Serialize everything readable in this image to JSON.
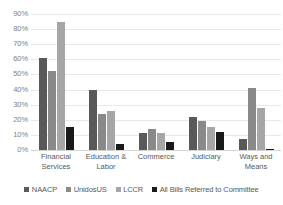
{
  "chart_data": {
    "type": "bar",
    "title": "",
    "subtitle": "",
    "xlabel": "",
    "ylabel": "",
    "ylim": [
      0,
      90
    ],
    "ytick_step": 10,
    "ytick_labels": [
      "90%",
      "80%",
      "70%",
      "60%",
      "50%",
      "40%",
      "30%",
      "20%",
      "10%",
      "0%"
    ],
    "grid": true,
    "grid_orientation": "horizontal",
    "legend_position": "bottom",
    "value_unit": "%",
    "categories": [
      "Financial Services",
      "Education & Labor",
      "Commerce",
      "Judiciary",
      "Ways and Means"
    ],
    "series": [
      {
        "name": "NAACP",
        "color": "#595959",
        "values": [
          61,
          40,
          11,
          22,
          7
        ]
      },
      {
        "name": "UnidosUS",
        "color": "#898989",
        "values": [
          52,
          24,
          14,
          19,
          41
        ]
      },
      {
        "name": "LCCR",
        "color": "#a6a6a6",
        "values": [
          85,
          26,
          11,
          15,
          28
        ]
      },
      {
        "name": "All Bills Referred to Committee",
        "color": "#1a1a1a",
        "values": [
          15,
          4,
          5,
          12,
          1
        ]
      }
    ]
  }
}
